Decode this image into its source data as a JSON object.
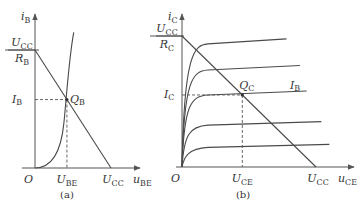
{
  "chart_data": [
    {
      "type": "line",
      "panel_label": "(a)",
      "title": "",
      "xlabel": {
        "main": "u",
        "sub": "BE"
      },
      "ylabel": {
        "main": "i",
        "sub": "B"
      },
      "origin_label": "O",
      "x_ticks": [
        {
          "main": "U",
          "sub": "BE",
          "x": 0.42
        },
        {
          "main": "U",
          "sub": "CC",
          "x": 1.0
        }
      ],
      "y_ticks": [
        {
          "main": "I",
          "sub": "B",
          "y": 0.58
        },
        {
          "frac_num_main": "U",
          "frac_num_sub": "CC",
          "frac_den_main": "R",
          "frac_den_sub": "B",
          "y": 1.0
        }
      ],
      "series": [
        {
          "name": "input characteristic",
          "shape": "exponential",
          "points": [
            [
              0,
              0
            ],
            [
              0.2,
              0.05
            ],
            [
              0.32,
              0.2
            ],
            [
              0.38,
              0.38
            ],
            [
              0.42,
              0.58
            ],
            [
              0.47,
              0.85
            ],
            [
              0.51,
              1.15
            ]
          ]
        },
        {
          "name": "load line",
          "points": [
            [
              0,
              1.0
            ],
            [
              1.0,
              0
            ]
          ]
        }
      ],
      "annotations": [
        {
          "main": "Q",
          "sub": "B",
          "x": 0.42,
          "y": 0.58
        }
      ],
      "xlim": [
        0,
        1.25
      ],
      "ylim": [
        0,
        1.3
      ],
      "grid": false
    },
    {
      "type": "line",
      "panel_label": "(b)",
      "title": "",
      "xlabel": {
        "main": "u",
        "sub": "CE"
      },
      "ylabel": {
        "main": "i",
        "sub": "C"
      },
      "origin_label": "O",
      "x_ticks": [
        {
          "main": "U",
          "sub": "CE",
          "x": 0.45
        },
        {
          "main": "U",
          "sub": "CC",
          "x": 1.0
        }
      ],
      "y_ticks": [
        {
          "main": "I",
          "sub": "C",
          "y": 0.55
        },
        {
          "frac_num_main": "U",
          "frac_num_sub": "CC",
          "frac_den_main": "R",
          "frac_den_sub": "C",
          "y": 1.0
        }
      ],
      "series": [
        {
          "name": "output curve 1",
          "level": 0.15,
          "end_x": 1.1
        },
        {
          "name": "output curve 2",
          "level": 0.32,
          "end_x": 1.04
        },
        {
          "name": "output curve 3 (I_B)",
          "level": 0.55,
          "end_x": 0.93
        },
        {
          "name": "output curve 4",
          "level": 0.74,
          "end_x": 0.88
        },
        {
          "name": "output curve 5",
          "level": 0.94,
          "end_x": 0.78
        },
        {
          "name": "load line",
          "points": [
            [
              0,
              1.0
            ],
            [
              1.0,
              0
            ]
          ]
        }
      ],
      "curve_label": {
        "main": "I",
        "sub": "B"
      },
      "annotations": [
        {
          "main": "Q",
          "sub": "C",
          "x": 0.45,
          "y": 0.55
        }
      ],
      "xlim": [
        0,
        1.2
      ],
      "ylim": [
        0,
        1.25
      ],
      "grid": false
    }
  ]
}
